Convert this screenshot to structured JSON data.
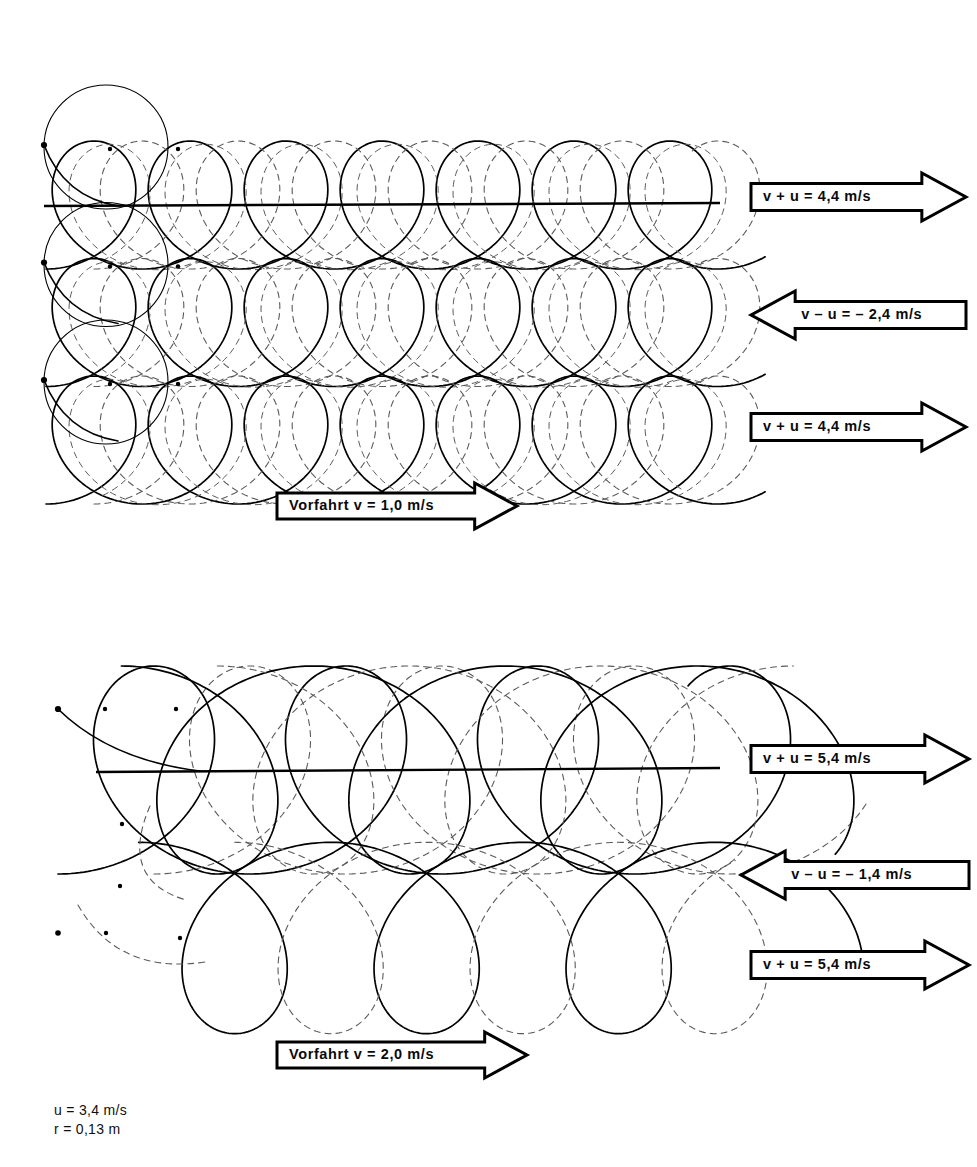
{
  "figure": {
    "kind": "trochoid-trajectory-diagram",
    "stroke_color": "#000000",
    "dashed_color": "#5a5a5a",
    "background": "#ffffff"
  },
  "panels": [
    {
      "id": "upper",
      "drive_arrow": {
        "label": "Vorfahrt v = 1,0 m/s",
        "direction": "right",
        "x": 277,
        "y": 483,
        "width": 240,
        "height": 46
      },
      "speed_arrows": [
        {
          "label": "v + u = 4,4 m/s",
          "direction": "right",
          "x": 751,
          "y": 173,
          "width": 215,
          "height": 48
        },
        {
          "label": "v – u = – 2,4 m/s",
          "direction": "left",
          "x": 751,
          "y": 291,
          "width": 215,
          "height": 48
        },
        {
          "label": "v + u = 4,4 m/s",
          "direction": "right",
          "x": 751,
          "y": 403,
          "width": 215,
          "height": 48
        }
      ],
      "rows": [
        {
          "baseline_y": 205,
          "loop_direction": "up",
          "cycles": 7,
          "period": 96,
          "radius": 63,
          "start_x": 48
        },
        {
          "baseline_y": 322,
          "loop_direction": "up",
          "cycles": 7,
          "period": 96,
          "radius": 63,
          "start_x": 48
        },
        {
          "baseline_y": 440,
          "loop_direction": "up",
          "cycles": 7,
          "period": 96,
          "radius": 63,
          "start_x": 48
        }
      ]
    },
    {
      "id": "lower",
      "drive_arrow": {
        "label": "Vorfahrt v = 2,0 m/s",
        "direction": "right",
        "x": 277,
        "y": 1032,
        "width": 250,
        "height": 46
      },
      "speed_arrows": [
        {
          "label": "v + u = 5,4 m/s",
          "direction": "right",
          "x": 751,
          "y": 735,
          "width": 218,
          "height": 48
        },
        {
          "label": "v – u = – 1,4 m/s",
          "direction": "left",
          "x": 741,
          "y": 851,
          "width": 228,
          "height": 48
        },
        {
          "label": "v + u = 5,4 m/s",
          "direction": "right",
          "x": 751,
          "y": 941,
          "width": 218,
          "height": 48
        }
      ],
      "rows": [
        {
          "baseline_y": 770,
          "loop_direction": "up",
          "cycles": 4,
          "period": 192,
          "radius": 100,
          "start_x": 58
        },
        {
          "baseline_y": 770,
          "loop_direction": "down",
          "cycles": 4,
          "period": 192,
          "radius": 100,
          "start_x": 58
        },
        {
          "baseline_y": 938,
          "loop_direction": "down",
          "cycles": 4,
          "period": 192,
          "radius": 100,
          "start_x": 58
        }
      ]
    }
  ],
  "legend": {
    "line1": "u = 3,4 m/s",
    "line2": "r = 0,13 m"
  }
}
